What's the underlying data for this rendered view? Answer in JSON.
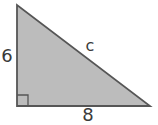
{
  "figure": {
    "type": "right-triangle-diagram",
    "labels": {
      "vertical_leg": "6",
      "horizontal_leg": "8",
      "hypotenuse": "c"
    },
    "triangle": {
      "points": "17,5 17,106 150,106"
    },
    "right_angle_marker": {
      "path": "M 28 106 L 28 95 L 17 95"
    }
  },
  "colors": {
    "background": "#ffffff",
    "triangle-fill": "#bcbcbc",
    "triangle-stroke": "#565656",
    "label-color": "#3a3a3a"
  }
}
